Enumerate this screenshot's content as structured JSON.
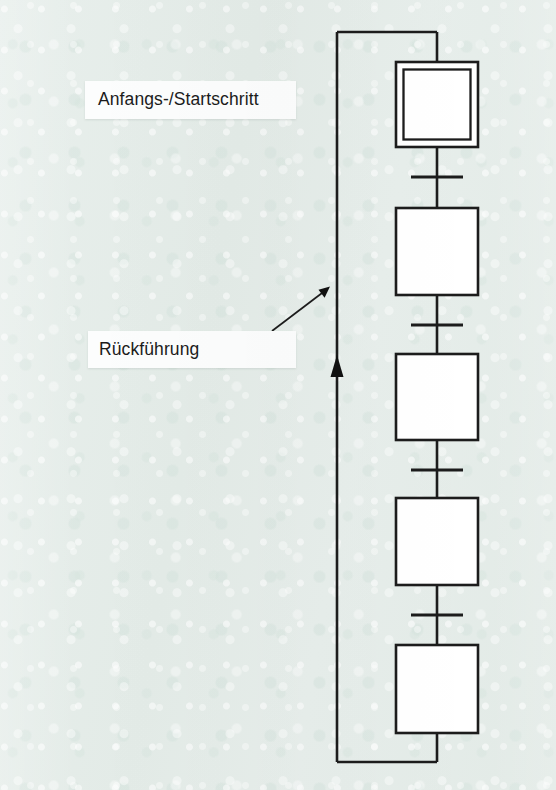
{
  "page": {
    "background_color": "#e5ede9",
    "ink_color": "#1c1c1c",
    "step_fill_color": "#ffffff",
    "label_fill_color": "#fcfdfd"
  },
  "diagram": {
    "kind": "sequential-function-chart",
    "title_visible": false,
    "callouts": [
      {
        "id": "start-step-callout",
        "text": "Anfangs-/Startschritt",
        "box": {
          "x": 85,
          "y": 81,
          "w": 211,
          "h": 38
        },
        "has_leader_line": false
      },
      {
        "id": "feedback-callout",
        "text": "Rückführung",
        "box": {
          "x": 88,
          "y": 331,
          "w": 208,
          "h": 37
        },
        "has_leader_line": true,
        "leader_from": {
          "x": 272,
          "y": 331
        },
        "leader_to": {
          "x": 329,
          "y": 288
        }
      }
    ],
    "steps": [
      {
        "id": "step-1",
        "type": "initial-step",
        "double_border": true,
        "x": 396,
        "y": 62,
        "w": 82,
        "h": 85,
        "label": ""
      },
      {
        "id": "step-2",
        "type": "step",
        "double_border": false,
        "x": 396,
        "y": 208,
        "w": 82,
        "h": 87,
        "label": ""
      },
      {
        "id": "step-3",
        "type": "step",
        "double_border": false,
        "x": 396,
        "y": 354,
        "w": 82,
        "h": 86,
        "label": ""
      },
      {
        "id": "step-4",
        "type": "step",
        "double_border": false,
        "x": 396,
        "y": 498,
        "w": 82,
        "h": 87,
        "label": ""
      },
      {
        "id": "step-5",
        "type": "step",
        "double_border": false,
        "x": 396,
        "y": 645,
        "w": 82,
        "h": 88,
        "label": ""
      }
    ],
    "transitions": [
      {
        "id": "transition-1",
        "y": 177,
        "x1": 411,
        "x2": 463,
        "label": ""
      },
      {
        "id": "transition-2",
        "y": 325,
        "x1": 411,
        "x2": 463,
        "label": ""
      },
      {
        "id": "transition-3",
        "y": 470,
        "x1": 411,
        "x2": 463,
        "label": ""
      },
      {
        "id": "transition-4",
        "y": 615,
        "x1": 411,
        "x2": 463,
        "label": ""
      }
    ],
    "connector_x": 437,
    "feedback_loop": {
      "id": "feedback-loop",
      "left_x": 337,
      "top_y": 32,
      "bottom_y": 762,
      "arrowhead_at": {
        "x": 337,
        "y": 358
      },
      "arrow_direction": "up"
    }
  }
}
